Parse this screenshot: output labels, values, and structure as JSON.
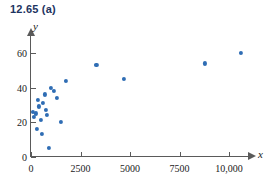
{
  "figure": {
    "title": "12.65  (a)",
    "background_color": "#ffffff",
    "axis_color": "#5a5a5a",
    "point_color": "#2f6db4",
    "title_color": "#1d3461"
  },
  "chart_data": {
    "type": "scatter",
    "title": "12.65  (a)",
    "xlabel": "x",
    "ylabel": "y",
    "xlim": [
      0,
      11500
    ],
    "ylim": [
      0,
      68
    ],
    "grid": false,
    "legend": null,
    "xticks": [
      0,
      2500,
      5000,
      7500,
      10000
    ],
    "xtick_labels": [
      "0",
      "2500",
      "5000",
      "7500",
      "10,000"
    ],
    "yticks": [
      0,
      20,
      40,
      60
    ],
    "ytick_labels": [
      "0",
      "20",
      "40",
      "60"
    ],
    "series": [
      {
        "name": "observations",
        "marker": "circle",
        "color": "#2f6db4",
        "points": [
          [
            100,
            26
          ],
          [
            150,
            23
          ],
          [
            250,
            25
          ],
          [
            300,
            16
          ],
          [
            350,
            33
          ],
          [
            400,
            29
          ],
          [
            500,
            21
          ],
          [
            550,
            13
          ],
          [
            600,
            31
          ],
          [
            700,
            36
          ],
          [
            750,
            27
          ],
          [
            800,
            24
          ],
          [
            900,
            5
          ],
          [
            1000,
            40
          ],
          [
            1150,
            38
          ],
          [
            1300,
            34
          ],
          [
            1500,
            20
          ],
          [
            1750,
            44
          ],
          [
            3300,
            53
          ],
          [
            4700,
            45
          ],
          [
            8800,
            54
          ],
          [
            10600,
            60
          ]
        ]
      }
    ]
  }
}
